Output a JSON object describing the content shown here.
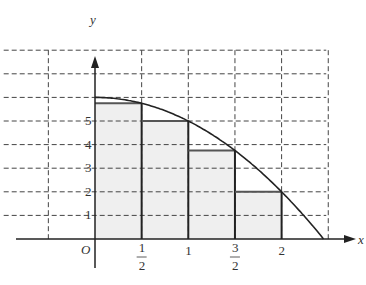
{
  "chart_data": {
    "type": "area",
    "title": "",
    "xlabel": "x",
    "ylabel": "y",
    "origin_label": "O",
    "function": "y = 6 - x^2",
    "curve_points": [
      [
        0,
        6
      ],
      [
        0.25,
        5.9375
      ],
      [
        0.5,
        5.75
      ],
      [
        0.75,
        5.4375
      ],
      [
        1,
        5
      ],
      [
        1.25,
        4.4375
      ],
      [
        1.5,
        3.75
      ],
      [
        1.75,
        2.9375
      ],
      [
        2,
        2
      ],
      [
        2.25,
        0.9375
      ],
      [
        2.449,
        0
      ]
    ],
    "rectangles": [
      {
        "x0": 0,
        "x1": 0.5,
        "height": 5.75
      },
      {
        "x0": 0.5,
        "x1": 1,
        "height": 5
      },
      {
        "x0": 1,
        "x1": 1.5,
        "height": 3.75
      },
      {
        "x0": 1.5,
        "x1": 2,
        "height": 2
      }
    ],
    "x_ticks": [
      {
        "value": 0.5,
        "num": "1",
        "den": "2"
      },
      {
        "value": 1,
        "label": "1"
      },
      {
        "value": 1.5,
        "num": "3",
        "den": "2"
      },
      {
        "value": 2,
        "label": "2"
      }
    ],
    "y_ticks": [
      1,
      2,
      3,
      4,
      5
    ],
    "grid": {
      "dashed": true,
      "x_step": 0.5,
      "y_step": 1,
      "x_range": [
        -1,
        2.5
      ],
      "y_range": [
        0,
        8
      ]
    },
    "colors": {
      "rect_fill": "#efefef",
      "line": "#222222",
      "grid": "#444444"
    }
  }
}
